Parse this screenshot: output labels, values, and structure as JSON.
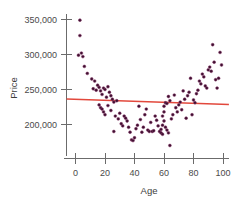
{
  "chart_data": {
    "type": "scatter",
    "title": "",
    "xlabel": "Age",
    "ylabel": "Price",
    "xlim": [
      -7,
      107
    ],
    "ylim": [
      168000,
      357000
    ],
    "xticks": [
      0,
      20,
      40,
      60,
      80,
      100
    ],
    "xticklabels": [
      "0",
      "20",
      "40",
      "60",
      "80",
      "100"
    ],
    "yticks": [
      200000,
      250000,
      300000,
      350000
    ],
    "yticklabels": [
      "200,000",
      "250,000",
      "300,000",
      "350,000"
    ],
    "grid": false,
    "legend": null,
    "point_color": "#3d1030",
    "point_edge_color": "#8a3a6b",
    "line_color": "#e2483c",
    "axis_color": "#6b6b6b",
    "text_color": "#4a4a4a",
    "series": [
      {
        "name": "Price vs Age",
        "marker": "circle",
        "points": [
          [
            3,
            349000
          ],
          [
            3,
            327000
          ],
          [
            2,
            299000
          ],
          [
            4,
            302000
          ],
          [
            5,
            297000
          ],
          [
            6,
            283000
          ],
          [
            8,
            273000
          ],
          [
            11,
            265000
          ],
          [
            13,
            262000
          ],
          [
            12,
            251000
          ],
          [
            14,
            249000
          ],
          [
            15,
            256000
          ],
          [
            16,
            253000
          ],
          [
            17,
            248000
          ],
          [
            18,
            243000
          ],
          [
            19,
            252000
          ],
          [
            20,
            250000
          ],
          [
            21,
            239000
          ],
          [
            22,
            254000
          ],
          [
            23,
            246000
          ],
          [
            24,
            241000
          ],
          [
            25,
            236000
          ],
          [
            26,
            232000
          ],
          [
            16,
            228000
          ],
          [
            17,
            224000
          ],
          [
            18,
            222000
          ],
          [
            19,
            218000
          ],
          [
            20,
            214000
          ],
          [
            22,
            227000
          ],
          [
            24,
            220000
          ],
          [
            26,
            190000
          ],
          [
            27,
            212000
          ],
          [
            28,
            234000
          ],
          [
            29,
            208000
          ],
          [
            30,
            216000
          ],
          [
            31,
            201000
          ],
          [
            32,
            198000
          ],
          [
            33,
            212000
          ],
          [
            34,
            209000
          ],
          [
            35,
            205000
          ],
          [
            36,
            196000
          ],
          [
            37,
            189000
          ],
          [
            38,
            178000
          ],
          [
            39,
            177000
          ],
          [
            40,
            181000
          ],
          [
            41,
            194000
          ],
          [
            42,
            199000
          ],
          [
            43,
            226000
          ],
          [
            44,
            207000
          ],
          [
            45,
            189000
          ],
          [
            46,
            196000
          ],
          [
            47,
            214000
          ],
          [
            48,
            222000
          ],
          [
            49,
            192000
          ],
          [
            50,
            190000
          ],
          [
            51,
            203000
          ],
          [
            52,
            190000
          ],
          [
            53,
            191000
          ],
          [
            54,
            212000
          ],
          [
            55,
            206000
          ],
          [
            56,
            198000
          ],
          [
            57,
            190000
          ],
          [
            58,
            188000
          ],
          [
            58,
            193000
          ],
          [
            59,
            199000
          ],
          [
            59,
            186000
          ],
          [
            59,
            212000
          ],
          [
            60,
            205000
          ],
          [
            60,
            218000
          ],
          [
            60,
            226000
          ],
          [
            61,
            231000
          ],
          [
            61,
            196000
          ],
          [
            62,
            192000
          ],
          [
            62,
            230000
          ],
          [
            63,
            240000
          ],
          [
            63,
            188000
          ],
          [
            64,
            170000
          ],
          [
            64,
            234000
          ],
          [
            65,
            208000
          ],
          [
            66,
            214000
          ],
          [
            67,
            242000
          ],
          [
            68,
            224000
          ],
          [
            69,
            218000
          ],
          [
            70,
            228000
          ],
          [
            71,
            232000
          ],
          [
            72,
            221000
          ],
          [
            73,
            248000
          ],
          [
            74,
            236000
          ],
          [
            75,
            209000
          ],
          [
            76,
            241000
          ],
          [
            77,
            246000
          ],
          [
            78,
            266000
          ],
          [
            79,
            214000
          ],
          [
            80,
            235000
          ],
          [
            81,
            231000
          ],
          [
            82,
            244000
          ],
          [
            83,
            249000
          ],
          [
            84,
            262000
          ],
          [
            85,
            258000
          ],
          [
            86,
            272000
          ],
          [
            87,
            268000
          ],
          [
            88,
            255000
          ],
          [
            89,
            252000
          ],
          [
            90,
            278000
          ],
          [
            91,
            282000
          ],
          [
            92,
            276000
          ],
          [
            93,
            314000
          ],
          [
            94,
            289000
          ],
          [
            95,
            264000
          ],
          [
            96,
            252000
          ],
          [
            97,
            266000
          ],
          [
            98,
            303000
          ],
          [
            99,
            285000
          ]
        ]
      }
    ],
    "trend_line": {
      "name": "linear-fit",
      "color": "#e2483c",
      "x_start": -6,
      "y_start": 236500,
      "x_end": 104,
      "y_end": 228500
    }
  }
}
